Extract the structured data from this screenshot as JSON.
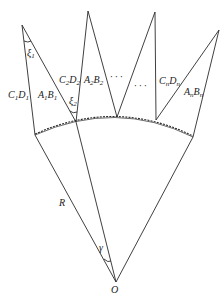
{
  "labels": {
    "c1d1": {
      "main1": "C",
      "sub1": "1",
      "main2": "D",
      "sub2": "1"
    },
    "a1b1": {
      "main1": "A",
      "sub1": "1",
      "main2": "B",
      "sub2": "1"
    },
    "c2d2": {
      "main1": "C",
      "sub1": "2",
      "main2": "D",
      "sub2": "2"
    },
    "a2b2": {
      "main1": "A",
      "sub1": "2",
      "main2": "B",
      "sub2": "2"
    },
    "cndn": {
      "main1": "C",
      "sub1": "n",
      "main2": "D",
      "sub2": "n"
    },
    "anbn": {
      "main1": "A",
      "sub1": "n",
      "main2": "B",
      "sub2": "n"
    },
    "xi1": {
      "main": "ξ",
      "sub": "1"
    },
    "xi2": {
      "main": "ξ",
      "sub": "2"
    },
    "ellipsis1": "· · ·",
    "ellipsis2": "· · ·",
    "radius": "R",
    "angle": "γ",
    "origin": "O"
  }
}
